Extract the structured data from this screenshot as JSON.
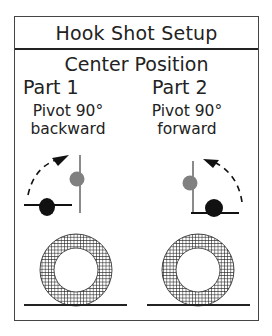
{
  "title": "Hook Shot Setup",
  "subtitle": "Center Position",
  "parts": [
    {
      "label": "Part 1",
      "instruction_line1": "Pivot 90°",
      "instruction_line2": "backward",
      "direction": "backward"
    },
    {
      "label": "Part 2",
      "instruction_line1": "Pivot 90°",
      "instruction_line2": "forward",
      "direction": "forward"
    }
  ],
  "colors": {
    "border": "#444444",
    "line": "#222222",
    "black_dot": "#111111",
    "gray_dot": "#808080",
    "gray_line": "#8a8a8a",
    "hatch": "#222222"
  }
}
